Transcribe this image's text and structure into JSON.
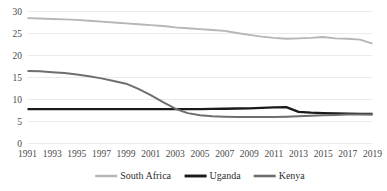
{
  "chart_data": {
    "type": "line",
    "title": "",
    "xlabel": "",
    "ylabel": "",
    "ylim": [
      0,
      30
    ],
    "yticks": [
      0,
      5,
      10,
      15,
      20,
      25,
      30
    ],
    "grid": true,
    "grid_color": "#e2e2e2",
    "legend_position": "bottom",
    "x": [
      1991,
      1992,
      1993,
      1994,
      1995,
      1996,
      1997,
      1998,
      1999,
      2000,
      2001,
      2002,
      2003,
      2004,
      2005,
      2006,
      2007,
      2008,
      2009,
      2010,
      2011,
      2012,
      2013,
      2014,
      2015,
      2016,
      2017,
      2018,
      2019
    ],
    "xtick_labels": [
      "1991",
      "1993",
      "1995",
      "1997",
      "1999",
      "2001",
      "2003",
      "2005",
      "2007",
      "2009",
      "2011",
      "2013",
      "2015",
      "2017",
      "2019"
    ],
    "xtick_values": [
      1991,
      1993,
      1995,
      1997,
      1999,
      2001,
      2003,
      2005,
      2007,
      2009,
      2011,
      2013,
      2015,
      2017,
      2019
    ],
    "series": [
      {
        "name": "South Africa",
        "color": "#b6b6b6",
        "width": 1.9,
        "values": [
          28.5,
          28.4,
          28.3,
          28.2,
          28.1,
          27.9,
          27.7,
          27.5,
          27.3,
          27.1,
          26.9,
          26.7,
          26.4,
          26.2,
          26.0,
          25.8,
          25.6,
          25.1,
          24.7,
          24.3,
          24.0,
          23.8,
          23.9,
          24.0,
          24.2,
          23.9,
          23.8,
          23.6,
          22.7
        ]
      },
      {
        "name": "Uganda",
        "color": "#1a1a1a",
        "width": 2.3,
        "values": [
          7.8,
          7.8,
          7.8,
          7.8,
          7.8,
          7.8,
          7.8,
          7.8,
          7.8,
          7.8,
          7.8,
          7.8,
          7.8,
          7.8,
          7.8,
          7.85,
          7.9,
          7.95,
          8.0,
          8.1,
          8.2,
          8.25,
          7.2,
          7.0,
          6.9,
          6.85,
          6.8,
          6.75,
          6.7
        ]
      },
      {
        "name": "Kenya",
        "color": "#6e6e6e",
        "width": 2.0,
        "values": [
          16.5,
          16.4,
          16.2,
          16.0,
          15.7,
          15.3,
          14.8,
          14.2,
          13.6,
          12.4,
          11.0,
          9.4,
          7.9,
          6.9,
          6.4,
          6.2,
          6.1,
          6.0,
          6.0,
          6.0,
          6.0,
          6.1,
          6.2,
          6.3,
          6.4,
          6.5,
          6.6,
          6.6,
          6.6
        ]
      }
    ]
  },
  "legend": {
    "items": [
      {
        "label": "South Africa"
      },
      {
        "label": "Uganda"
      },
      {
        "label": "Kenya"
      }
    ]
  }
}
